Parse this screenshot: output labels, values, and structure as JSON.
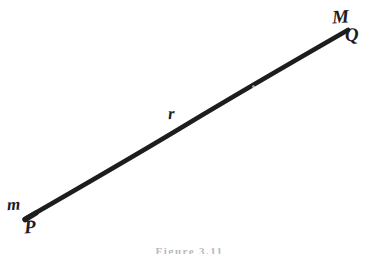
{
  "figure": {
    "kind": "hand-drawn-geometry-diagram",
    "background_color": "#ffffff",
    "ink_color": "#1d1d1f",
    "width": 379,
    "height": 254,
    "caption": "Figure 3.11",
    "caption_color": "#b9b9b9",
    "segment": {
      "name": "line-r",
      "label": "r",
      "stroke_color": "#1d1d1f",
      "stroke_width": 4.6,
      "x1": 25,
      "y1": 219,
      "x2": 348,
      "y2": 30
    },
    "labels": [
      {
        "id": "M",
        "text": "M",
        "role": "plane-or-set-label",
        "x": 340,
        "y": 17,
        "case": "upper"
      },
      {
        "id": "Q",
        "text": "Q",
        "role": "point-label",
        "x": 352,
        "y": 35,
        "case": "upper"
      },
      {
        "id": "r",
        "text": "r",
        "role": "line-label",
        "x": 173,
        "y": 114,
        "case": "lower"
      },
      {
        "id": "m",
        "text": "m",
        "role": "measure-label",
        "x": 12,
        "y": 204,
        "case": "lower"
      },
      {
        "id": "P",
        "text": "P",
        "role": "point-label",
        "x": 30,
        "y": 227,
        "case": "upper"
      }
    ]
  }
}
